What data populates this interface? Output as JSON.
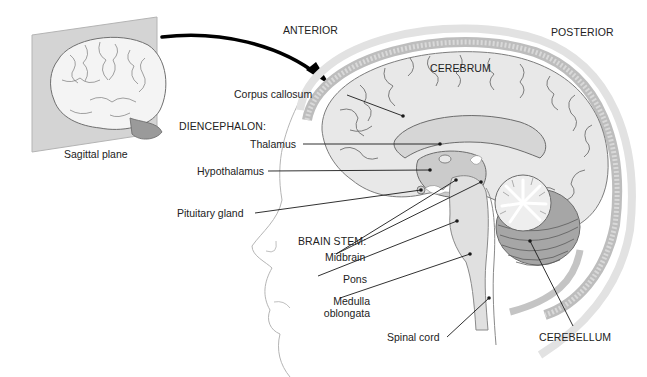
{
  "diagram": {
    "inset": {
      "caption": "Sagittal plane"
    },
    "orientation": {
      "anterior": "ANTERIOR",
      "posterior": "POSTERIOR"
    },
    "regions": {
      "cerebrum": "CEREBRUM",
      "cerebellum": "CEREBELLUM",
      "diencephalon_heading": "DIENCEPHALON:",
      "brain_stem_heading": "BRAIN STEM:"
    },
    "labels": {
      "corpus_callosum": "Corpus callosum",
      "thalamus": "Thalamus",
      "hypothalamus": "Hypothalamus",
      "pituitary_gland": "Pituitary gland",
      "midbrain": "Midbrain",
      "pons": "Pons",
      "medulla_line1": "Medulla",
      "medulla_line2": "oblongata",
      "spinal_cord": "Spinal cord"
    },
    "colors": {
      "background": "#ffffff",
      "brain_fill": "#e6e6e6",
      "brain_dark": "#c4c4c4",
      "skull": "#d2d2d2",
      "outline": "#8a8a8a",
      "leader_line": "#1a1a1a",
      "plane": "#cfcfcf"
    }
  }
}
